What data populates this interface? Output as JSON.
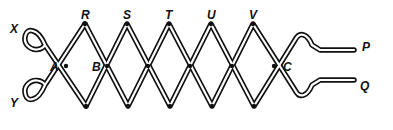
{
  "diagram": {
    "type": "lazy-tongs mechanism (pantograph linkage)",
    "colors": {
      "stroke": "#111111",
      "background": "#ffffff"
    },
    "labels": [
      {
        "id": "X",
        "text": "X",
        "x": 10,
        "y": 23
      },
      {
        "id": "Y",
        "text": "Y",
        "x": 10,
        "y": 97
      },
      {
        "id": "R",
        "text": "R",
        "x": 81,
        "y": 9
      },
      {
        "id": "S",
        "text": "S",
        "x": 123,
        "y": 9
      },
      {
        "id": "T",
        "text": "T",
        "x": 165,
        "y": 9
      },
      {
        "id": "U",
        "text": "U",
        "x": 207,
        "y": 9
      },
      {
        "id": "V",
        "text": "V",
        "x": 249,
        "y": 9
      },
      {
        "id": "A",
        "text": "A",
        "x": 50,
        "y": 61
      },
      {
        "id": "B",
        "text": "B",
        "x": 92,
        "y": 61
      },
      {
        "id": "C",
        "text": "C",
        "x": 283,
        "y": 61
      },
      {
        "id": "P",
        "text": "P",
        "x": 362,
        "y": 41
      },
      {
        "id": "Q",
        "text": "Q",
        "x": 360,
        "y": 80
      }
    ],
    "top_joints_x": [
      85,
      127,
      169,
      211,
      253
    ],
    "bottom_joints_x": [
      86,
      128,
      170,
      212,
      254
    ],
    "top_y": 24,
    "bottom_y": 106,
    "cross_y": 66
  }
}
